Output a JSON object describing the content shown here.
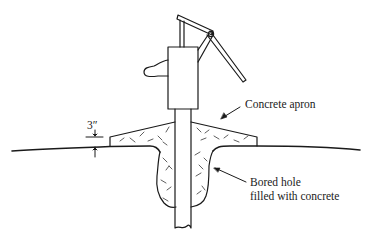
{
  "diagram": {
    "labels": {
      "apron": "Concrete apron",
      "dimension": "3″",
      "hole_line1": "Bored hole",
      "hole_line2": "filled with concrete"
    },
    "colors": {
      "ink": "#1a1a1a",
      "background": "#ffffff"
    }
  }
}
